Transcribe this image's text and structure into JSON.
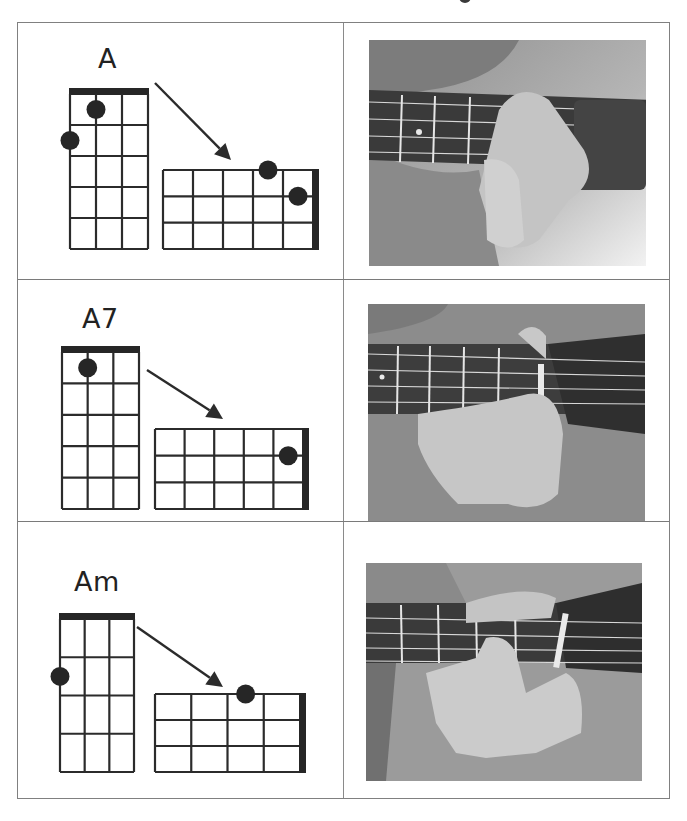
{
  "chords": [
    {
      "name": "A",
      "vertical": {
        "strings": 4,
        "frets": 5,
        "dots": [
          {
            "string": 2,
            "fret": 1
          },
          {
            "string": 1,
            "fret": 2
          }
        ]
      },
      "horizontal": {
        "strings": 4,
        "frets": 5,
        "dots": [
          {
            "string": 1,
            "fret": 2,
            "on_line": true
          },
          {
            "string": 2,
            "fret": 1
          }
        ]
      },
      "photo_alt": "Hand fretting the A chord on a ukulele neck"
    },
    {
      "name": "A7",
      "vertical": {
        "strings": 4,
        "frets": 5,
        "dots": [
          {
            "string": 2,
            "fret": 1
          }
        ]
      },
      "horizontal": {
        "strings": 4,
        "frets": 5,
        "dots": [
          {
            "string": 2,
            "fret": 1
          }
        ]
      },
      "photo_alt": "Hand fretting the A7 chord on a ukulele neck"
    },
    {
      "name": "Am",
      "vertical": {
        "strings": 4,
        "frets": 4,
        "dots": [
          {
            "string": 1,
            "fret": 2
          }
        ]
      },
      "horizontal": {
        "strings": 4,
        "frets": 4,
        "dots": [
          {
            "string": 1,
            "fret": 2,
            "on_line": true
          }
        ]
      },
      "photo_alt": "Hand fretting the Am chord on a ukulele neck"
    }
  ],
  "colors": {
    "grid": "#2b2b2b",
    "dot": "#262626",
    "nut": "#262626",
    "border": "#808080"
  }
}
